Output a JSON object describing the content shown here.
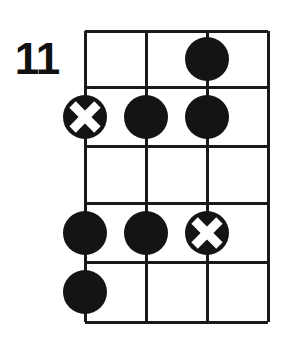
{
  "diagram": {
    "kind": "chord-diagram",
    "instrument_strings": 3,
    "fret_count": 5,
    "starting_fret_label": "11",
    "colors": {
      "background": "#ffffff",
      "grid": "#1a1a1a",
      "marker_fill": "#141414",
      "marker_cross": "#ffffff"
    },
    "geometry": {
      "grid_left": 85,
      "grid_right": 268,
      "grid_top": 31,
      "grid_bottom": 322,
      "string_x": [
        85,
        146,
        207,
        268
      ],
      "fret_y": [
        31,
        87,
        146,
        203,
        262,
        322
      ],
      "marker_radius": 22,
      "grid_line_width": 3
    },
    "markers": [
      {
        "name": "marker-fret1-string3",
        "type": "dot",
        "string": 3,
        "fret": 1,
        "cx": 207,
        "cy": 59
      },
      {
        "name": "marker-fret2-string1",
        "type": "cross",
        "string": 1,
        "fret": 2,
        "cx": 85,
        "cy": 117
      },
      {
        "name": "marker-fret2-string2",
        "type": "dot",
        "string": 2,
        "fret": 2,
        "cx": 146,
        "cy": 117
      },
      {
        "name": "marker-fret2-string3",
        "type": "dot",
        "string": 3,
        "fret": 2,
        "cx": 207,
        "cy": 117
      },
      {
        "name": "marker-fret4-string1",
        "type": "dot",
        "string": 1,
        "fret": 4,
        "cx": 85,
        "cy": 233
      },
      {
        "name": "marker-fret4-string2",
        "type": "dot",
        "string": 2,
        "fret": 4,
        "cx": 146,
        "cy": 233
      },
      {
        "name": "marker-fret4-string3",
        "type": "cross",
        "string": 3,
        "fret": 4,
        "cx": 207,
        "cy": 233
      },
      {
        "name": "marker-fret5-string1",
        "type": "dot",
        "string": 1,
        "fret": 5,
        "cx": 85,
        "cy": 292
      }
    ]
  }
}
